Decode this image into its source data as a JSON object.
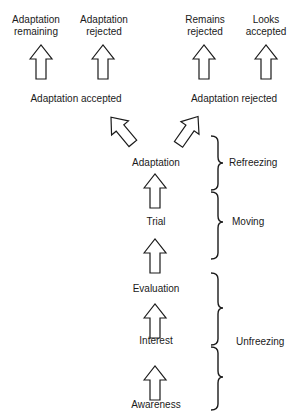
{
  "diagram": {
    "type": "adoption-process-flow",
    "stages": [
      {
        "id": "awareness",
        "label": "Awareness"
      },
      {
        "id": "interest",
        "label": "Interest"
      },
      {
        "id": "evaluation",
        "label": "Evaluation"
      },
      {
        "id": "trial",
        "label": "Trial"
      },
      {
        "id": "adaptation",
        "label": "Adaptation"
      }
    ],
    "outcomes": {
      "accepted": {
        "label": "Adaptation accepted",
        "results": [
          {
            "line1": "Adaptation",
            "line2": "remaining"
          },
          {
            "line1": "Adaptation",
            "line2": "rejected"
          }
        ]
      },
      "rejected": {
        "label": "Adaptation rejected",
        "results": [
          {
            "line1": "Remains",
            "line2": "rejected"
          },
          {
            "line1": "Looks",
            "line2": "accepted"
          }
        ]
      }
    },
    "phases": [
      {
        "id": "refreezing",
        "label": "Refreezing"
      },
      {
        "id": "moving",
        "label": "Moving"
      },
      {
        "id": "unfreezing",
        "label": "Unfreezing"
      }
    ],
    "colors": {
      "stroke": "#1a1a1a",
      "fill": "#ffffff"
    }
  }
}
